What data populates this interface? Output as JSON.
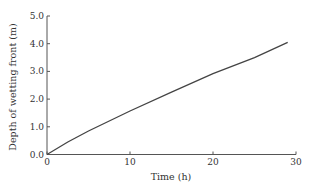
{
  "chart_data": {
    "type": "line",
    "title": "",
    "xlabel": "Time (h)",
    "ylabel": "Depth of wetting front (m)",
    "xlim": [
      0,
      30
    ],
    "ylim": [
      0,
      5
    ],
    "xticks": [
      0,
      10,
      20,
      30
    ],
    "yticks": [
      0.0,
      1.0,
      2.0,
      3.0,
      4.0,
      5.0
    ],
    "xtick_labels": [
      "0",
      "10",
      "20",
      "30"
    ],
    "ytick_labels": [
      "0.0",
      "1.0",
      "2.0",
      "3.0",
      "4.0",
      "5.0"
    ],
    "grid": false,
    "legend": null,
    "series": [
      {
        "name": "Depth of wetting front",
        "color": "#444444",
        "x": [
          0,
          2.5,
          5,
          10,
          15,
          20,
          25,
          29
        ],
        "y": [
          0,
          0.45,
          0.85,
          1.57,
          2.25,
          2.92,
          3.5,
          4.05
        ]
      }
    ]
  }
}
